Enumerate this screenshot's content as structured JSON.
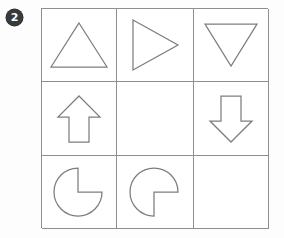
{
  "item": {
    "badge_label": "2",
    "badge_color": "#3a3a3a",
    "badge_text_color": "#ffffff"
  },
  "grid": {
    "rows": 3,
    "columns": 3,
    "border_color": "#8e8e8e",
    "cell_background": "#ffffff",
    "shape_stroke_color": "#7d7d7d",
    "cells": [
      {
        "position": "row1-col1",
        "shape": "triangle-up",
        "shape_label": "upward pointing triangle outline",
        "empty": false
      },
      {
        "position": "row1-col2",
        "shape": "triangle-right",
        "shape_label": "rightward pointing triangle outline",
        "empty": false
      },
      {
        "position": "row1-col3",
        "shape": "triangle-down",
        "shape_label": "downward pointing triangle outline",
        "empty": false
      },
      {
        "position": "row2-col1",
        "shape": "arrow-up",
        "shape_label": "upward block arrow outline",
        "empty": false
      },
      {
        "position": "row2-col2",
        "shape": "none",
        "shape_label": "empty cell",
        "empty": true
      },
      {
        "position": "row2-col3",
        "shape": "arrow-down",
        "shape_label": "downward block arrow outline",
        "empty": false
      },
      {
        "position": "row3-col1",
        "shape": "pie-notch-upper-right",
        "shape_label": "circle with quarter wedge removed from upper right",
        "empty": false
      },
      {
        "position": "row3-col2",
        "shape": "pie-notch-lower-right",
        "shape_label": "circle with quarter wedge removed from lower right",
        "empty": false
      },
      {
        "position": "row3-col3",
        "shape": "none",
        "shape_label": "empty answer cell",
        "empty": true
      }
    ]
  }
}
